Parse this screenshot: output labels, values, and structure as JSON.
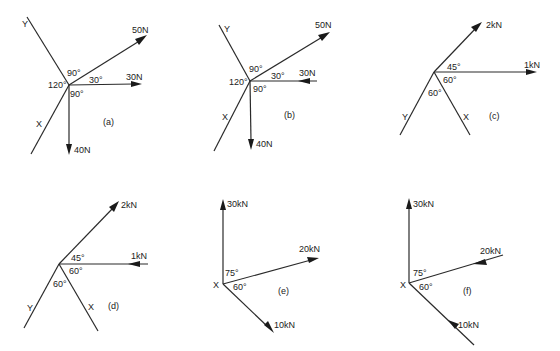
{
  "figure": {
    "panels": [
      {
        "id": "a",
        "label": "(a)",
        "axes": {
          "y": "Y",
          "x": "X"
        },
        "forces": [
          {
            "label": "50N",
            "direction": "outward",
            "angle_from_horizontal": "30°"
          },
          {
            "label": "30N",
            "direction": "outward",
            "angle": "0°"
          },
          {
            "label": "40N",
            "direction": "outward",
            "angle": "-90°"
          }
        ],
        "angles": [
          "90°",
          "30°",
          "120°",
          "90°"
        ]
      },
      {
        "id": "b",
        "label": "(b)",
        "axes": {
          "y": "Y",
          "x": "X"
        },
        "forces": [
          {
            "label": "50N",
            "direction": "outward"
          },
          {
            "label": "30N",
            "direction": "inward"
          },
          {
            "label": "40N",
            "direction": "outward"
          }
        ],
        "angles": [
          "90°",
          "30°",
          "120°",
          "90°"
        ]
      },
      {
        "id": "c",
        "label": "(c)",
        "axes": {
          "y": "Y",
          "x": "X"
        },
        "forces": [
          {
            "label": "2kN",
            "direction": "outward"
          },
          {
            "label": "1kN",
            "direction": "outward"
          }
        ],
        "angles": [
          "45°",
          "60°",
          "60°"
        ]
      },
      {
        "id": "d",
        "label": "(d)",
        "axes": {
          "y": "Y",
          "x": "X"
        },
        "forces": [
          {
            "label": "2kN",
            "direction": "outward"
          },
          {
            "label": "1kN",
            "direction": "inward"
          }
        ],
        "angles": [
          "45°",
          "60°",
          "60°"
        ]
      },
      {
        "id": "e",
        "label": "(e)",
        "axes": {
          "x": "X"
        },
        "forces": [
          {
            "label": "30kN",
            "direction": "outward"
          },
          {
            "label": "20kN",
            "direction": "outward"
          },
          {
            "label": "10kN",
            "direction": "outward"
          }
        ],
        "angles": [
          "75°",
          "60°"
        ]
      },
      {
        "id": "f",
        "label": "(f)",
        "axes": {
          "x": "X"
        },
        "forces": [
          {
            "label": "30kN",
            "direction": "outward"
          },
          {
            "label": "20kN",
            "direction": "inward"
          },
          {
            "label": "10kN",
            "direction": "inward"
          }
        ],
        "angles": [
          "75°",
          "60°"
        ]
      }
    ]
  }
}
